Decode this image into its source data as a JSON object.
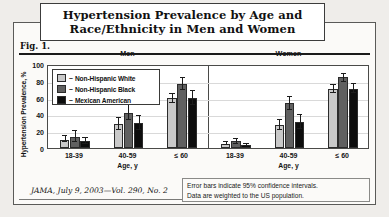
{
  "figure": {
    "title_line1": "Hypertension Prevalence by Age and",
    "title_line2": "Race/Ethnicity in Men and Women",
    "figure_label": "Fig. 1.",
    "citation": "JAMA, July 9, 2003—Vol. 290, No. 2",
    "note_line1": "Error bars indicate 95% confidence intervals.",
    "note_line2": "Data are weighted to the US population."
  },
  "colors": {
    "non_hispanic_white": "#c9c9c9",
    "non_hispanic_black": "#606060",
    "mexican_american": "#0d0d0d",
    "axis": "#4a4a48",
    "grid": "#d9d9d9",
    "page_background": "#efedea",
    "panel_background": "#ffffff"
  },
  "legend": {
    "entries": [
      {
        "label": "Non-Hispanic White",
        "dash": "–",
        "color": "#c9c9c9"
      },
      {
        "label": "Non-Hispanic Black",
        "dash": "–",
        "color": "#606060"
      },
      {
        "label": "Mexican American",
        "dash": "–",
        "color": "#0d0d0d"
      }
    ]
  },
  "chart_data": {
    "type": "bar",
    "title": "Hypertension Prevalence by Age and Race/Ethnicity in Men and Women",
    "ylabel": "Hypertension Prevalence, %",
    "xlabel": "Age, y",
    "ylim": [
      0,
      100
    ],
    "yticks": [
      100,
      80,
      60,
      40,
      20,
      0
    ],
    "ytick_labels": [
      "100",
      "80",
      "60",
      "40",
      "20",
      "0"
    ],
    "grid": true,
    "legend_position": "upper-left",
    "categories": [
      "18-39",
      "40-59",
      "≤ 60"
    ],
    "panels": [
      {
        "name": "Men",
        "label": "Men",
        "series": [
          {
            "name": "Non-Hispanic White",
            "values": [
              10,
              29,
              59
            ],
            "ci_low": [
              7,
              22,
              54
            ],
            "ci_high": [
              14,
              36,
              64
            ]
          },
          {
            "name": "Non-Hispanic Black",
            "values": [
              13,
              42,
              76
            ],
            "ci_low": [
              7,
              33,
              69
            ],
            "ci_high": [
              20,
              51,
              83
            ]
          },
          {
            "name": "Mexican American",
            "values": [
              8,
              30,
              59
            ],
            "ci_low": [
              5,
              22,
              51
            ],
            "ci_high": [
              12,
              38,
              68
            ]
          }
        ]
      },
      {
        "name": "Women",
        "label": "Women",
        "series": [
          {
            "name": "Non-Hispanic White",
            "values": [
              5,
              27,
              70
            ],
            "ci_low": [
              3,
              21,
              66
            ],
            "ci_high": [
              7,
              33,
              75
            ]
          },
          {
            "name": "Non-Hispanic Black",
            "values": [
              8,
              53,
              84
            ],
            "ci_low": [
              5,
              45,
              79
            ],
            "ci_high": [
              11,
              61,
              88
            ]
          },
          {
            "name": "Mexican American",
            "values": [
              3,
              31,
              70
            ],
            "ci_low": [
              2,
              23,
              65
            ],
            "ci_high": [
              5,
              39,
              76
            ]
          }
        ]
      }
    ],
    "annotations": [
      "Error bars indicate 95% confidence intervals.",
      "Data are weighted to the US population."
    ]
  }
}
